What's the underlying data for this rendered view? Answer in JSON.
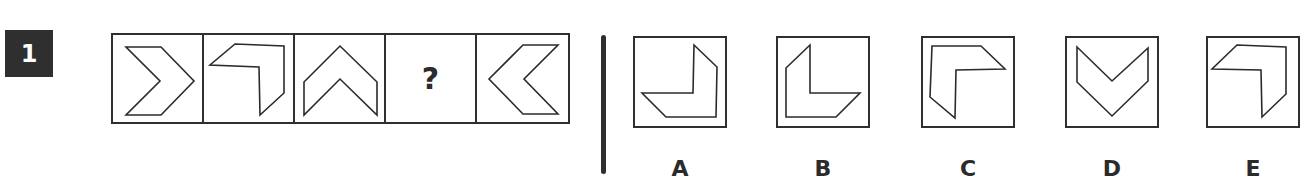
{
  "question": {
    "number": "1",
    "sequence": [
      {
        "type": "shape",
        "shape": "chevron-right"
      },
      {
        "type": "shape",
        "shape": "angle-top-right"
      },
      {
        "type": "shape",
        "shape": "chevron-up"
      },
      {
        "type": "missing",
        "text": "?"
      },
      {
        "type": "shape",
        "shape": "chevron-left"
      }
    ]
  },
  "options": [
    {
      "label": "A",
      "shape": "angle-bottom-right"
    },
    {
      "label": "B",
      "shape": "angle-bottom-left"
    },
    {
      "label": "C",
      "shape": "angle-top-left"
    },
    {
      "label": "D",
      "shape": "chevron-down"
    },
    {
      "label": "E",
      "shape": "angle-top-right"
    }
  ],
  "colors": {
    "ink": "#2b2b2b",
    "number_badge_bg": "#2f2f2f",
    "number_badge_text": "#ffffff",
    "background": "#ffffff"
  }
}
